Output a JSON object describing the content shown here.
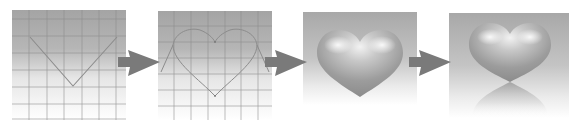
{
  "diagram": {
    "steps": [
      {
        "id": "step-1",
        "description": "Grid with V-shaped guide path"
      },
      {
        "id": "step-2",
        "description": "Grid with heart outline path"
      },
      {
        "id": "step-3",
        "description": "Shaded 3D heart on gradient background"
      },
      {
        "id": "step-4",
        "description": "Shaded 3D heart with reflection"
      }
    ],
    "arrows": [
      {
        "from": "step-1",
        "to": "step-2"
      },
      {
        "from": "step-2",
        "to": "step-3"
      },
      {
        "from": "step-3",
        "to": "step-4"
      }
    ],
    "colors": {
      "panel_gradient_top": "#a6a6a6",
      "panel_gradient_bottom": "#ffffff",
      "grid_line": "#8a8a8a",
      "guide_path": "#8c8c8c",
      "arrow": "#7a7a7a",
      "heart_highlight": "#ececec",
      "heart_body": "#9a9a9a",
      "heart_shadow": "#7e7e7e"
    }
  }
}
